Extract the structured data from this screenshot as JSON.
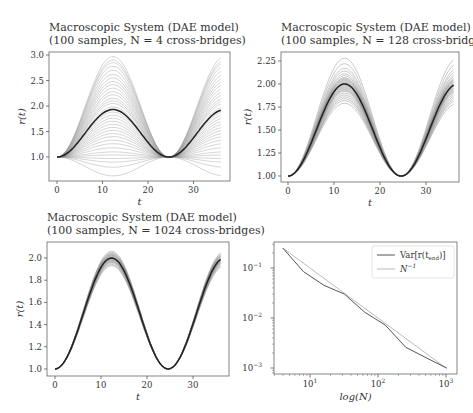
{
  "chart_data": [
    {
      "type": "line",
      "title": "Macroscopic System (DAE model)",
      "subtitle": "(100 samples, N = 4 cross-bridges)",
      "xlabel": "t",
      "ylabel": "r(t)",
      "xlim": [
        -1.5,
        37
      ],
      "ylim": [
        0.55,
        3.05
      ],
      "xticks": [
        0,
        10,
        20,
        30
      ],
      "yticks": [
        1.0,
        1.5,
        2.0,
        2.5,
        3.0
      ],
      "ytick_labels": [
        "1.0",
        "1.5",
        "2.0",
        "2.5",
        "3.0"
      ],
      "series_count": 100,
      "mean_series": {
        "name": "mean",
        "x": [
          0,
          6,
          12.3,
          18,
          24.6,
          30,
          36
        ],
        "y": [
          1.0,
          1.45,
          1.93,
          1.45,
          1.0,
          1.45,
          1.93
        ]
      },
      "envelope": {
        "max_peak": 2.97,
        "min_trough": 0.63
      },
      "amplitudes": [
        2.97,
        2.9,
        2.85,
        2.78,
        2.7,
        2.62,
        2.55,
        2.48,
        2.42,
        2.35,
        2.28,
        2.22,
        2.15,
        2.1,
        2.05,
        1.98,
        1.93,
        1.88,
        1.82,
        1.76,
        1.7,
        1.64,
        1.58,
        1.52,
        1.46,
        1.4,
        1.33,
        1.26,
        1.18,
        1.1,
        1.04,
        0.97,
        0.9,
        0.8,
        0.63
      ],
      "grid": false
    },
    {
      "type": "line",
      "title": "Macroscopic System (DAE model)",
      "subtitle": "(100 samples, N = 128 cross-bridges)",
      "xlabel": "t",
      "ylabel": "r(t)",
      "xlim": [
        -1.5,
        37
      ],
      "ylim": [
        0.96,
        2.3
      ],
      "xticks": [
        0,
        10,
        20,
        30
      ],
      "yticks": [
        1.0,
        1.25,
        1.5,
        1.75,
        2.0,
        2.25
      ],
      "ytick_labels": [
        "1.00",
        "1.25",
        "1.50",
        "1.75",
        "2.00",
        "2.25"
      ],
      "series_count": 100,
      "mean_series": {
        "name": "mean",
        "x": [
          0,
          6,
          12.3,
          18,
          24.6,
          30,
          36
        ],
        "y": [
          1.0,
          1.5,
          2.0,
          1.5,
          1.0,
          1.5,
          2.0
        ]
      },
      "envelope": {
        "max_peak": 2.28,
        "min_peak": 1.79
      },
      "amplitudes": [
        2.28,
        2.22,
        2.17,
        2.14,
        2.11,
        2.09,
        2.07,
        2.06,
        2.05,
        2.04,
        2.03,
        2.02,
        2.01,
        2.0,
        2.0,
        1.99,
        1.98,
        1.97,
        1.96,
        1.95,
        1.94,
        1.93,
        1.92,
        1.9,
        1.88,
        1.86,
        1.84,
        1.82,
        1.79
      ],
      "grid": false
    },
    {
      "type": "line",
      "title": "Macroscopic System (DAE model)",
      "subtitle": "(100 samples, N = 1024 cross-bridges)",
      "xlabel": "t",
      "ylabel": "r(t)",
      "xlim": [
        -1.5,
        37
      ],
      "ylim": [
        0.97,
        2.13
      ],
      "xticks": [
        0,
        10,
        20,
        30
      ],
      "yticks": [
        1.0,
        1.2,
        1.4,
        1.6,
        1.8,
        2.0
      ],
      "ytick_labels": [
        "1.0",
        "1.2",
        "1.4",
        "1.6",
        "1.8",
        "2.0"
      ],
      "series_count": 100,
      "mean_series": {
        "name": "mean",
        "x": [
          0,
          6,
          12.3,
          18,
          24.6,
          30,
          36
        ],
        "y": [
          1.0,
          1.5,
          2.0,
          1.5,
          1.0,
          1.5,
          2.0
        ]
      },
      "envelope": {
        "max_peak": 2.06,
        "min_peak": 1.93
      },
      "amplitudes": [
        2.06,
        2.05,
        2.04,
        2.035,
        2.03,
        2.025,
        2.02,
        2.015,
        2.01,
        2.005,
        2.0,
        1.995,
        1.99,
        1.985,
        1.98,
        1.975,
        1.97,
        1.965,
        1.96,
        1.95,
        1.94,
        1.93
      ],
      "grid": false
    },
    {
      "type": "line",
      "title": "",
      "xlabel": "log(N)",
      "ylabel": "",
      "xscale": "log",
      "yscale": "log",
      "xlim": [
        3.2,
        1200
      ],
      "ylim": [
        0.0008,
        0.35
      ],
      "xticks": [
        10,
        100,
        1000
      ],
      "xtick_labels": [
        "10^1",
        "10^2",
        "10^3"
      ],
      "yticks": [
        0.001,
        0.01,
        0.1
      ],
      "ytick_labels": [
        "10^-3",
        "10^-2",
        "10^-1"
      ],
      "legend_position": "upper right",
      "series": [
        {
          "name": "Var[r(t_end)]",
          "color": "#555555",
          "x": [
            4,
            8,
            16,
            32,
            64,
            128,
            256,
            512,
            1024
          ],
          "y": [
            0.25,
            0.085,
            0.045,
            0.03,
            0.013,
            0.0072,
            0.0026,
            0.0016,
            0.001
          ]
        },
        {
          "name": "N^-1",
          "color": "#bbbbbb",
          "x": [
            4,
            1024
          ],
          "y": [
            0.25,
            0.000977
          ]
        }
      ],
      "grid": false
    }
  ],
  "panels": [
    {
      "title": "Macroscopic System (DAE model)",
      "subtitle": "(100 samples, N = 4 cross-bridges)",
      "xlabel": "t",
      "ylabel": "r(t)",
      "xtick_labels": [
        "0",
        "10",
        "20",
        "30"
      ],
      "ytick_labels": [
        "1.0",
        "1.5",
        "2.0",
        "2.5",
        "3.0"
      ]
    },
    {
      "title": "Macroscopic System (DAE model)",
      "subtitle": "(100 samples, N = 128 cross-bridges)",
      "xlabel": "t",
      "ylabel": "r(t)",
      "xtick_labels": [
        "0",
        "10",
        "20",
        "30"
      ],
      "ytick_labels": [
        "1.00",
        "1.25",
        "1.50",
        "1.75",
        "2.00",
        "2.25"
      ]
    },
    {
      "title": "Macroscopic System (DAE model)",
      "subtitle": "(100 samples, N = 1024 cross-bridges)",
      "xlabel": "t",
      "ylabel": "r(t)",
      "xtick_labels": [
        "0",
        "10",
        "20",
        "30"
      ],
      "ytick_labels": [
        "1.0",
        "1.2",
        "1.4",
        "1.6",
        "1.8",
        "2.0"
      ]
    },
    {
      "xlabel": "log(N)",
      "xtick_base": [
        "10",
        "10",
        "10"
      ],
      "xtick_exp": [
        "1",
        "2",
        "3"
      ],
      "ytick_base": [
        "10",
        "10",
        "10"
      ],
      "ytick_exp": [
        "−3",
        "−2",
        "−1"
      ],
      "legend": [
        {
          "label_main": "Var[r(t",
          "label_sub": "end",
          "label_tail": ")]"
        },
        {
          "label_main": "N",
          "label_sup": "−1"
        }
      ]
    }
  ],
  "colors": {
    "mean_line": "#222222",
    "sample_line": "#888888",
    "var_line": "#555555",
    "ref_line": "#bbbbbb",
    "frame": "#666666"
  }
}
